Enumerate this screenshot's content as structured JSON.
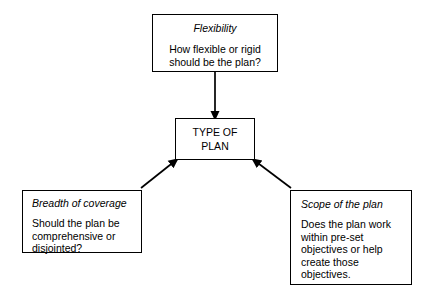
{
  "diagram": {
    "background_color": "#ffffff",
    "line_color": "#000000",
    "nodes": {
      "flexibility": {
        "heading": "Flexibility",
        "body_lines": [
          "How flexible or rigid",
          "should be the plan?"
        ]
      },
      "type_of_plan": {
        "body_lines": [
          "TYPE OF",
          "PLAN"
        ]
      },
      "breadth_of_coverage": {
        "heading": "Breadth of coverage",
        "body_lines": [
          "Should the plan be",
          "comprehensive or",
          "disjointed?"
        ]
      },
      "scope_of_the_plan": {
        "heading": "Scope of the plan",
        "body_lines": [
          "Does the plan work",
          "within pre-set",
          "objectives or help",
          "create those",
          "objectives."
        ]
      }
    },
    "arrows": [
      {
        "name": "flexibility-to-type-of-plan",
        "from": "flexibility",
        "to": "type_of_plan",
        "style": "vertical-down"
      },
      {
        "name": "breadth-to-type-of-plan",
        "from": "breadth_of_coverage",
        "to": "type_of_plan",
        "style": "diagonal-up-right"
      },
      {
        "name": "scope-to-type-of-plan",
        "from": "scope_of_the_plan",
        "to": "type_of_plan",
        "style": "diagonal-up-left"
      }
    ]
  }
}
